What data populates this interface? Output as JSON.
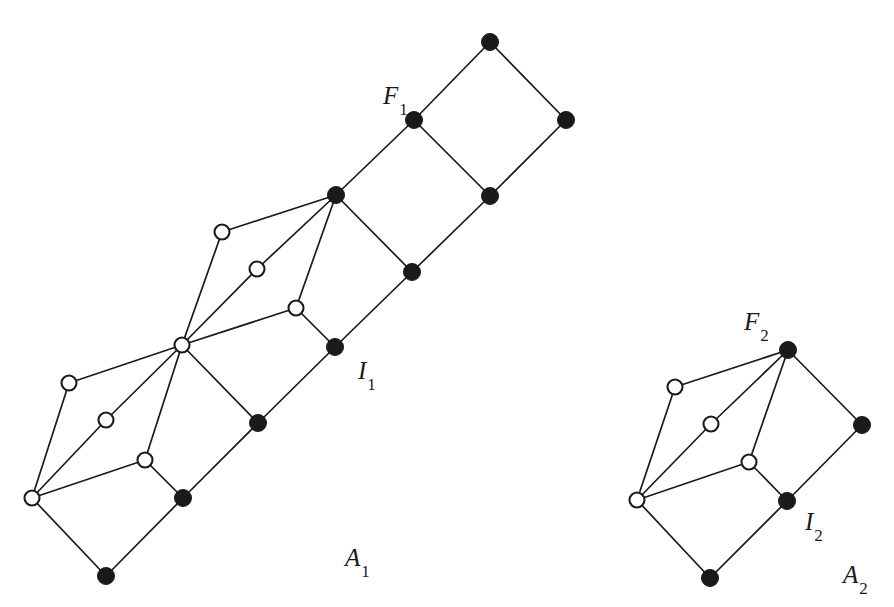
{
  "figure": {
    "background_color": "#ffffff",
    "node_colors": {
      "filled": "#1a1a1a",
      "open_fill": "#ffffff",
      "open_stroke": "#1a1a1a",
      "edge": "#1a1a1a"
    },
    "node_radius_filled": 8.5,
    "node_radius_open": 7.5
  },
  "labels": [
    {
      "id": "F1",
      "base": "F",
      "sub": "1",
      "x": 383,
      "y": 104
    },
    {
      "id": "I1",
      "base": "I",
      "sub": "1",
      "x": 358,
      "y": 379
    },
    {
      "id": "A1",
      "base": "A",
      "sub": "1",
      "x": 345,
      "y": 566
    },
    {
      "id": "F2",
      "base": "F",
      "sub": "2",
      "x": 744,
      "y": 330
    },
    {
      "id": "I2",
      "base": "I",
      "sub": "2",
      "x": 805,
      "y": 530
    },
    {
      "id": "A2",
      "base": "A",
      "sub": "2",
      "x": 843,
      "y": 583
    }
  ],
  "components": [
    {
      "name": "A1",
      "nodes": [
        {
          "id": "a1_top",
          "x": 490,
          "y": 42,
          "type": "filled"
        },
        {
          "id": "a1_right1",
          "x": 566,
          "y": 120,
          "type": "filled"
        },
        {
          "id": "a1_f1",
          "x": 414,
          "y": 120,
          "type": "filled"
        },
        {
          "id": "a1_mid_r",
          "x": 490,
          "y": 196,
          "type": "filled"
        },
        {
          "id": "a1_hubF",
          "x": 336,
          "y": 195,
          "type": "filled"
        },
        {
          "id": "a1_lowdia",
          "x": 412,
          "y": 272,
          "type": "filled"
        },
        {
          "id": "a1_i1",
          "x": 335,
          "y": 347,
          "type": "filled"
        },
        {
          "id": "a1_o_up1",
          "x": 222,
          "y": 232,
          "type": "open"
        },
        {
          "id": "a1_o_up2",
          "x": 257,
          "y": 269,
          "type": "open"
        },
        {
          "id": "a1_o_up3",
          "x": 296,
          "y": 308,
          "type": "open"
        },
        {
          "id": "a1_hubO",
          "x": 182,
          "y": 345,
          "type": "open"
        },
        {
          "id": "a1_fill_mid",
          "x": 258,
          "y": 423,
          "type": "filled"
        },
        {
          "id": "a1_o_lo1",
          "x": 69,
          "y": 383,
          "type": "open"
        },
        {
          "id": "a1_o_lo2",
          "x": 106,
          "y": 420,
          "type": "open"
        },
        {
          "id": "a1_o_lo3",
          "x": 145,
          "y": 460,
          "type": "open"
        },
        {
          "id": "a1_hubO2",
          "x": 32,
          "y": 498,
          "type": "open"
        },
        {
          "id": "a1_fill_lo",
          "x": 183,
          "y": 498,
          "type": "filled"
        },
        {
          "id": "a1_bot",
          "x": 106,
          "y": 576,
          "type": "filled"
        }
      ],
      "edges": [
        [
          "a1_top",
          "a1_right1"
        ],
        [
          "a1_top",
          "a1_f1"
        ],
        [
          "a1_f1",
          "a1_mid_r"
        ],
        [
          "a1_right1",
          "a1_mid_r"
        ],
        [
          "a1_f1",
          "a1_hubF"
        ],
        [
          "a1_hubF",
          "a1_lowdia"
        ],
        [
          "a1_mid_r",
          "a1_lowdia"
        ],
        [
          "a1_hubF",
          "a1_o_up1"
        ],
        [
          "a1_hubF",
          "a1_o_up2"
        ],
        [
          "a1_hubF",
          "a1_o_up3"
        ],
        [
          "a1_o_up1",
          "a1_hubO"
        ],
        [
          "a1_o_up2",
          "a1_hubO"
        ],
        [
          "a1_o_up3",
          "a1_hubO"
        ],
        [
          "a1_o_up3",
          "a1_i1"
        ],
        [
          "a1_i1",
          "a1_lowdia"
        ],
        [
          "a1_hubO",
          "a1_fill_mid"
        ],
        [
          "a1_i1",
          "a1_fill_mid"
        ],
        [
          "a1_hubO",
          "a1_o_lo1"
        ],
        [
          "a1_hubO",
          "a1_o_lo2"
        ],
        [
          "a1_hubO",
          "a1_o_lo3"
        ],
        [
          "a1_o_lo1",
          "a1_hubO2"
        ],
        [
          "a1_o_lo2",
          "a1_hubO2"
        ],
        [
          "a1_o_lo3",
          "a1_hubO2"
        ],
        [
          "a1_o_lo3",
          "a1_fill_lo"
        ],
        [
          "a1_fill_lo",
          "a1_fill_mid"
        ],
        [
          "a1_hubO2",
          "a1_bot"
        ],
        [
          "a1_bot",
          "a1_fill_lo"
        ]
      ]
    },
    {
      "name": "A2",
      "nodes": [
        {
          "id": "a2_f2",
          "x": 788,
          "y": 350,
          "type": "filled"
        },
        {
          "id": "a2_right",
          "x": 862,
          "y": 425,
          "type": "filled"
        },
        {
          "id": "a2_o1",
          "x": 675,
          "y": 387,
          "type": "open"
        },
        {
          "id": "a2_o2",
          "x": 711,
          "y": 424,
          "type": "open"
        },
        {
          "id": "a2_o3",
          "x": 749,
          "y": 462,
          "type": "open"
        },
        {
          "id": "a2_hub",
          "x": 637,
          "y": 500,
          "type": "open"
        },
        {
          "id": "a2_i2",
          "x": 787,
          "y": 501,
          "type": "filled"
        },
        {
          "id": "a2_bot",
          "x": 710,
          "y": 578,
          "type": "filled"
        }
      ],
      "edges": [
        [
          "a2_f2",
          "a2_right"
        ],
        [
          "a2_right",
          "a2_i2"
        ],
        [
          "a2_f2",
          "a2_o1"
        ],
        [
          "a2_f2",
          "a2_o2"
        ],
        [
          "a2_f2",
          "a2_o3"
        ],
        [
          "a2_o1",
          "a2_hub"
        ],
        [
          "a2_o2",
          "a2_hub"
        ],
        [
          "a2_o3",
          "a2_hub"
        ],
        [
          "a2_o3",
          "a2_i2"
        ],
        [
          "a2_hub",
          "a2_bot"
        ],
        [
          "a2_bot",
          "a2_i2"
        ]
      ]
    }
  ]
}
